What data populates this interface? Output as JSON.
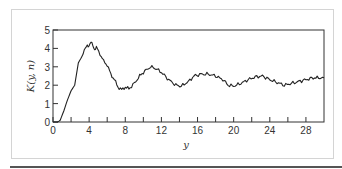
{
  "chart_data": {
    "type": "line",
    "title": "",
    "xlabel": "y",
    "ylabel": "K(y, n)",
    "xlim": [
      0,
      30
    ],
    "ylim": [
      0,
      5
    ],
    "xticks": [
      0,
      2,
      4,
      6,
      8,
      10,
      12,
      14,
      16,
      18,
      20,
      22,
      24,
      26,
      28
    ],
    "xtick_labels": [
      "0",
      "4",
      "8",
      "12",
      "16",
      "20",
      "24",
      "28"
    ],
    "xtick_label_values": [
      0,
      4,
      8,
      12,
      16,
      20,
      24,
      28
    ],
    "yticks": [
      0,
      1,
      2,
      3,
      4,
      5
    ],
    "ytick_labels": [
      "0",
      "1",
      "2",
      "3",
      "4",
      "5"
    ],
    "grid": false,
    "series": [
      {
        "name": "K(y, n)",
        "x": [
          0,
          0.5,
          0.8,
          1.2,
          1.6,
          2.0,
          2.4,
          2.6,
          2.8,
          3.2,
          3.6,
          3.8,
          4.0,
          4.2,
          4.4,
          4.6,
          4.8,
          5.2,
          5.6,
          6.0,
          6.4,
          6.8,
          7.2,
          7.6,
          8.0,
          8.4,
          9.0,
          9.6,
          10.0,
          10.8,
          11.4,
          12.0,
          12.8,
          13.6,
          14.2,
          15.0,
          15.6,
          16.4,
          17.2,
          18.0,
          18.8,
          19.4,
          20.0,
          20.8,
          21.6,
          22.4,
          23.2,
          24.0,
          24.8,
          25.6,
          26.4,
          27.2,
          28.0,
          28.8,
          30.0
        ],
        "y": [
          0,
          0,
          0.1,
          0.6,
          1.2,
          1.7,
          2.0,
          2.6,
          3.2,
          3.6,
          4.0,
          4.2,
          4.15,
          4.3,
          4.2,
          3.95,
          4.05,
          3.7,
          3.3,
          3.1,
          2.6,
          2.3,
          1.9,
          1.75,
          1.9,
          1.8,
          2.1,
          2.5,
          2.7,
          3.0,
          2.9,
          2.7,
          2.3,
          2.0,
          1.95,
          2.2,
          2.5,
          2.6,
          2.6,
          2.5,
          2.3,
          2.0,
          1.95,
          2.1,
          2.3,
          2.45,
          2.5,
          2.3,
          2.15,
          2.0,
          2.1,
          2.2,
          2.3,
          2.4,
          2.4
        ]
      }
    ]
  }
}
